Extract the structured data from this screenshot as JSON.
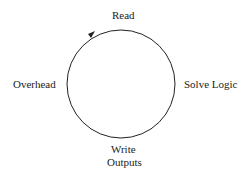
{
  "diagram": {
    "type": "cycle",
    "direction": "clockwise",
    "stages": [
      {
        "label": "Read",
        "position": "top"
      },
      {
        "label": "Solve Logic",
        "position": "right"
      },
      {
        "label": "Write Outputs",
        "line1": "Write",
        "line2": "Outputs",
        "position": "bottom"
      },
      {
        "label": "Overhead",
        "position": "left"
      }
    ],
    "stroke_color": "#222222"
  }
}
